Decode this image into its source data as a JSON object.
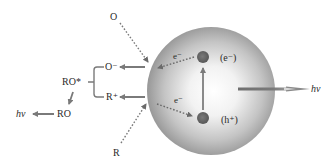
{
  "diagram": {
    "type": "photophysical-mechanism",
    "colors": {
      "background": "#ffffff",
      "sphere_edge": "#8a8a8a",
      "sphere_center": "#ffffff",
      "arrow": "#7a7a7a",
      "dot": "#6e6e6e",
      "text": "#2a2a2a"
    },
    "labels": {
      "oxidant": "O",
      "oxidant_radical": "O⁻",
      "reductant": "R",
      "reductant_radical": "R⁺",
      "excited_intermediate": "RO*",
      "ground_product": "RO",
      "emission_left": "hv",
      "emission_right": "hv",
      "electron_out": "e⁻",
      "electron_in": "e⁻",
      "electron_state": "(e⁻)",
      "hole_state": "(h⁺)"
    },
    "nodes": [
      {
        "id": "O",
        "label": "O"
      },
      {
        "id": "O-",
        "label": "O⁻"
      },
      {
        "id": "R",
        "label": "R"
      },
      {
        "id": "R+",
        "label": "R⁺"
      },
      {
        "id": "RO*",
        "label": "RO*"
      },
      {
        "id": "RO",
        "label": "RO"
      },
      {
        "id": "hv_left",
        "label": "hv"
      },
      {
        "id": "particle",
        "label": ""
      },
      {
        "id": "e_state",
        "label": "(e⁻)"
      },
      {
        "id": "h_state",
        "label": "(h⁺)"
      },
      {
        "id": "hv_right",
        "label": "hv"
      }
    ],
    "edges": [
      {
        "from": "O",
        "to": "particle",
        "style": "dotted"
      },
      {
        "from": "particle",
        "to": "O-",
        "style": "solid"
      },
      {
        "from": "R",
        "to": "particle",
        "style": "dotted"
      },
      {
        "from": "particle",
        "to": "R+",
        "style": "solid"
      },
      {
        "from": "O- + R+",
        "to": "RO*",
        "style": "bracket"
      },
      {
        "from": "RO*",
        "to": "RO",
        "style": "solid"
      },
      {
        "from": "RO",
        "to": "hv_left",
        "style": "solid"
      },
      {
        "from": "e_state",
        "to": "particle-surface",
        "label": "e⁻",
        "style": "dotted"
      },
      {
        "from": "particle-surface",
        "to": "h_state",
        "label": "e⁻",
        "style": "dotted"
      },
      {
        "from": "h_state",
        "to": "e_state",
        "style": "solid"
      },
      {
        "from": "particle",
        "to": "hv_right",
        "style": "solid"
      }
    ]
  }
}
